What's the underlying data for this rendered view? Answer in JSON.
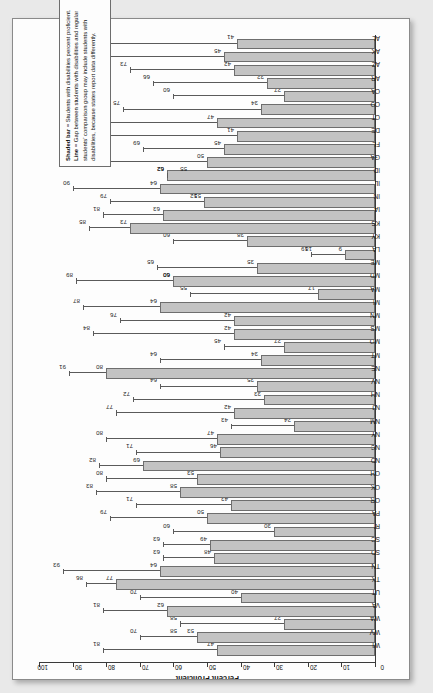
{
  "document": {
    "kind": "scanned-report-page",
    "paper_color": "#fdfdfd",
    "background_color": "#e9e9e9"
  },
  "legend": {
    "line1_label": "Shaded bar",
    "line1_text": " = Students with disabilities percent proficient.",
    "line2_label": "Line",
    "line2_text": " = Gap between students with disabilities and regular",
    "line3_text": "students’ comparison group may include students with disabilities, because states report data differently."
  },
  "chart_data": {
    "type": "bar",
    "title": "",
    "xlabel": "",
    "ylabel": "Percent Proficient",
    "axis_label": "Percent Proficient",
    "ylim": [
      0,
      100
    ],
    "tick_labels": [
      "100",
      "90",
      "80",
      "70",
      "60",
      "50",
      "40",
      "30",
      "20",
      "10",
      "0"
    ],
    "tick_values": [
      100,
      90,
      80,
      70,
      60,
      50,
      40,
      30,
      20,
      10,
      0
    ],
    "grid": false,
    "legend_position": "left-inside",
    "orientation": "horizontal-bars-rotated-page",
    "axis_direction": "100 at top, 0 at bottom",
    "series": [
      {
        "name": "Students with disabilities percent proficient",
        "key": "bar"
      },
      {
        "name": "Regular students percent proficient (line end)",
        "key": "line"
      }
    ],
    "categories": [
      "WI",
      "WV",
      "WA",
      "VA",
      "UT",
      "TX",
      "TN",
      "SD",
      "SC",
      "RI",
      "PA",
      "OR",
      "OK",
      "OH",
      "ND",
      "NC",
      "NY",
      "NM",
      "NJ",
      "NH",
      "NV",
      "NE",
      "MT",
      "MO",
      "MS",
      "MN",
      "MI",
      "MA",
      "MD",
      "ME",
      "LA",
      "KY",
      "KS",
      "IA",
      "IN",
      "IL",
      "ID",
      "GA",
      "FL",
      "DE",
      "CT",
      "CO",
      "CA",
      "AR",
      "AZ",
      "AK",
      "AL"
    ],
    "rows": [
      {
        "state": "WI",
        "bar": 47,
        "line": 81,
        "bar_label": "47",
        "line_label": "81"
      },
      {
        "state": "WV",
        "bar": 53,
        "line": 70,
        "bar_label": "53",
        "line_label": "70",
        "extra_label": "58"
      },
      {
        "state": "WA",
        "bar": 27,
        "line": 58,
        "bar_label": "27",
        "line_label": "58"
      },
      {
        "state": "VA",
        "bar": 62,
        "line": 81,
        "bar_label": "62",
        "line_label": "81"
      },
      {
        "state": "UT",
        "bar": 40,
        "line": 70,
        "bar_label": "40",
        "line_label": "70"
      },
      {
        "state": "TX",
        "bar": 77,
        "line": 86,
        "bar_label": "77",
        "line_label": "86"
      },
      {
        "state": "TN",
        "bar": 64,
        "line": 93,
        "bar_label": "64",
        "line_label": "93"
      },
      {
        "state": "SD",
        "bar": 48,
        "line": 63,
        "bar_label": "48",
        "line_label": "63"
      },
      {
        "state": "SC",
        "bar": 49,
        "line": 63,
        "bar_label": "49",
        "line_label": "63"
      },
      {
        "state": "RI",
        "bar": 30,
        "line": 60,
        "bar_label": "30",
        "line_label": "60"
      },
      {
        "state": "PA",
        "bar": 50,
        "line": 79,
        "bar_label": "50",
        "line_label": "79"
      },
      {
        "state": "OR",
        "bar": 43,
        "line": 71,
        "bar_label": "43",
        "line_label": "71"
      },
      {
        "state": "OK",
        "bar": 58,
        "line": 83,
        "bar_label": "58",
        "line_label": "83"
      },
      {
        "state": "OH",
        "bar": 53,
        "line": 80,
        "bar_label": "53",
        "line_label": "80"
      },
      {
        "state": "ND",
        "bar": 69,
        "line": 82,
        "bar_label": "69",
        "line_label": "82"
      },
      {
        "state": "NC",
        "bar": 46,
        "line": 71,
        "bar_label": "46",
        "line_label": "71"
      },
      {
        "state": "NY",
        "bar": 47,
        "line": 80,
        "bar_label": "47",
        "line_label": "80"
      },
      {
        "state": "NM",
        "bar": 24,
        "line": 43,
        "bar_label": "24",
        "line_label": "43"
      },
      {
        "state": "NJ",
        "bar": 42,
        "line": 77,
        "bar_label": "42",
        "line_label": "77"
      },
      {
        "state": "NH",
        "bar": 33,
        "line": 72,
        "bar_label": "33",
        "line_label": "72"
      },
      {
        "state": "NV",
        "bar": 35,
        "line": 64,
        "bar_label": "35",
        "line_label": "64"
      },
      {
        "state": "NE",
        "bar": 80,
        "line": 91,
        "bar_label": "80",
        "line_label": "91"
      },
      {
        "state": "MT",
        "bar": 34,
        "line": 64,
        "bar_label": "34",
        "line_label": "64"
      },
      {
        "state": "MO",
        "bar": 27,
        "line": 45,
        "bar_label": "27",
        "line_label": "45"
      },
      {
        "state": "MS",
        "bar": 42,
        "line": 84,
        "bar_label": "42",
        "line_label": "84"
      },
      {
        "state": "MN",
        "bar": 42,
        "line": 76,
        "bar_label": "42",
        "line_label": "76"
      },
      {
        "state": "MI",
        "bar": 64,
        "line": 87,
        "bar_label": "64",
        "line_label": "87"
      },
      {
        "state": "MA",
        "bar": 17,
        "line": 55,
        "bar_label": "17",
        "line_label": "55"
      },
      {
        "state": "MD",
        "bar": 60,
        "line": 89,
        "bar_label": "60",
        "line_label": "89",
        "extra_label": "60"
      },
      {
        "state": "ME",
        "bar": 35,
        "line": 65,
        "bar_label": "35",
        "line_label": "65"
      },
      {
        "state": "LA",
        "bar": 9,
        "line": 19,
        "bar_label": "9",
        "line_label": "19",
        "extra_label": "18"
      },
      {
        "state": "KY",
        "bar": 38,
        "line": 60,
        "bar_label": "38",
        "line_label": "60"
      },
      {
        "state": "KS",
        "bar": 73,
        "line": 85,
        "bar_label": "73",
        "line_label": "85"
      },
      {
        "state": "IA",
        "bar": 63,
        "line": 81,
        "bar_label": "63",
        "line_label": "81"
      },
      {
        "state": "IN",
        "bar": 51,
        "line": 79,
        "bar_label": "51",
        "line_label": "79",
        "extra_label": "52"
      },
      {
        "state": "IL",
        "bar": 64,
        "line": 90,
        "bar_label": "64",
        "line_label": "90"
      },
      {
        "state": "ID",
        "bar": 62,
        "line": 62,
        "bar_label": "62",
        "line_label": "62",
        "extra_label": "55"
      },
      {
        "state": "GA",
        "bar": 50,
        "line": 83,
        "bar_label": "50",
        "line_label": "83"
      },
      {
        "state": "FL",
        "bar": 45,
        "line": 69,
        "bar_label": "45",
        "line_label": "69"
      },
      {
        "state": "DE",
        "bar": 41,
        "line": 82,
        "bar_label": "41",
        "line_label": "82"
      },
      {
        "state": "CT",
        "bar": 47,
        "line": 85,
        "bar_label": "47",
        "line_label": "85"
      },
      {
        "state": "CO",
        "bar": 34,
        "line": 75,
        "bar_label": "34",
        "line_label": "75"
      },
      {
        "state": "CA",
        "bar": 27,
        "line": 60,
        "bar_label": "27",
        "line_label": "60"
      },
      {
        "state": "AR",
        "bar": 32,
        "line": 66,
        "bar_label": "32",
        "line_label": "66"
      },
      {
        "state": "AZ",
        "bar": 42,
        "line": 73,
        "bar_label": "42",
        "line_label": "73"
      },
      {
        "state": "AK",
        "bar": 45,
        "line": 81,
        "bar_label": "45",
        "line_label": "81"
      },
      {
        "state": "AL",
        "bar": 41,
        "line": 83,
        "bar_label": "41",
        "line_label": "83"
      }
    ]
  },
  "colors": {
    "bar_fill": "#c3c3c3",
    "bar_stroke": "#6e6e6e",
    "line": "#5a5a5a",
    "axis": "#3a3a3a",
    "text": "#111111"
  }
}
